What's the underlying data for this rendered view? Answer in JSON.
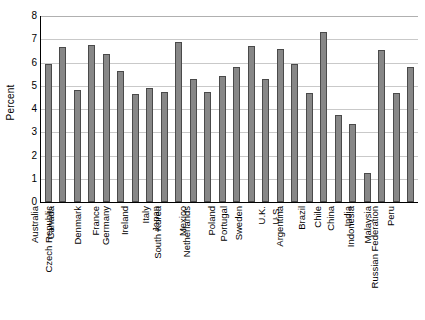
{
  "chart_data": {
    "type": "bar",
    "title": "",
    "subtitle": "",
    "xlabel": "",
    "ylabel": "Percent",
    "ylim": [
      0,
      8
    ],
    "ytick_step": 1,
    "yticks": [
      "0",
      "1",
      "2",
      "3",
      "4",
      "5",
      "6",
      "7",
      "8"
    ],
    "grid": true,
    "legend": false,
    "legend_position": "none",
    "categories": [
      "Australia",
      "Canada",
      "Czech Republic",
      "Denmark",
      "France",
      "Germany",
      "Ireland",
      "Italy",
      "Japan",
      "South Korea",
      "Mexico",
      "Netherlands",
      "Poland",
      "Portugal",
      "Sweden",
      "U.K.",
      "U.S.",
      "Argentina",
      "Brazil",
      "Chile",
      "China",
      "India",
      "Indonesia",
      "Malaysia",
      "Peru",
      "Russian Federation"
    ],
    "values": [
      5.95,
      6.65,
      4.8,
      6.75,
      6.35,
      5.65,
      4.65,
      4.9,
      4.75,
      6.9,
      5.3,
      4.75,
      5.4,
      5.8,
      6.7,
      5.3,
      6.6,
      5.95,
      4.7,
      7.3,
      3.75,
      3.35,
      1.25,
      6.55,
      4.7,
      5.8
    ],
    "bar_color": "#878787",
    "bar_edge_color": "#4a4a4a",
    "grid_color": "#c9c9c9",
    "axis_color": "#000000"
  }
}
